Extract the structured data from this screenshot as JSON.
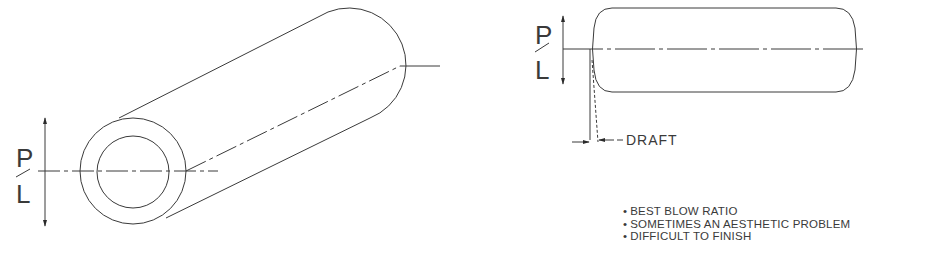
{
  "left_figure": {
    "title": "isometric tube with parting line",
    "parting_line_label": {
      "top": "P",
      "slash": "/",
      "bottom": "L"
    }
  },
  "right_figure": {
    "title": "side view of part with draft",
    "parting_line_label": {
      "top": "P",
      "slash": "/",
      "bottom": "L"
    },
    "draft_label": "DRAFT"
  },
  "notes": [
    "BEST BLOW RATIO",
    "SOMETIMES AN AESTHETIC PROBLEM",
    "DIFFICULT TO FINISH"
  ],
  "colors": {
    "line": "#3a3a3a",
    "background": "#ffffff"
  }
}
